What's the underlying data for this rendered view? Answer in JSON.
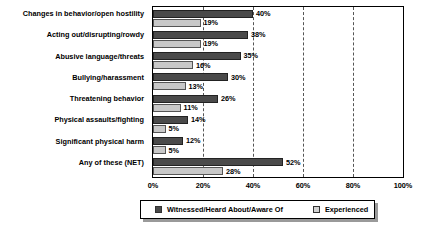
{
  "chart_data": {
    "type": "bar",
    "orientation": "horizontal",
    "title": "",
    "xlabel": "",
    "ylabel": "",
    "xlim": [
      0,
      100
    ],
    "xticks": [
      "0%",
      "20%",
      "40%",
      "60%",
      "80%",
      "100%"
    ],
    "grid": "vertical-dashed-at-20-40-60-80",
    "legend_position": "bottom",
    "categories": [
      "Changes in behavior/open hostility",
      "Acting out/disrupting/rowdy",
      "Abusive language/threats",
      "Bullying/harassment",
      "Threatening behavior",
      "Physical assaults/fighting",
      "Significant physical harm",
      "Any of these (NET)"
    ],
    "series": [
      {
        "name": "Witnessed/Heard About/Aware Of",
        "color": "#4a4a4a",
        "values": [
          40,
          38,
          35,
          30,
          26,
          14,
          12,
          52
        ],
        "labels": [
          "40%",
          "38%",
          "35%",
          "30%",
          "26%",
          "14%",
          "12%",
          "52%"
        ]
      },
      {
        "name": "Experienced",
        "color": "#c8c8c8",
        "values": [
          19,
          19,
          16,
          13,
          11,
          5,
          5,
          28
        ],
        "labels": [
          "19%",
          "19%",
          "16%",
          "13%",
          "11%",
          "5%",
          "5%",
          "28%"
        ]
      }
    ]
  }
}
